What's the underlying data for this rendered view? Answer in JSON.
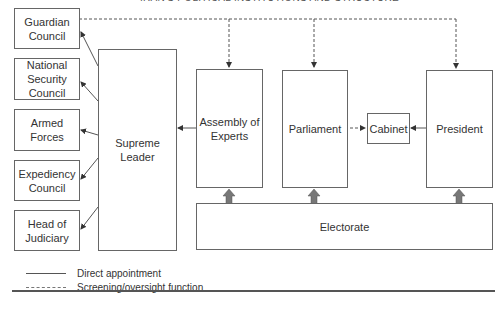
{
  "title": "IRAN'S POLITICAL INSTITUTIONS AND STRUCTURE",
  "appointees": [
    {
      "label": "Guardian Council"
    },
    {
      "label": "National Security Council"
    },
    {
      "label": "Armed Forces"
    },
    {
      "label": "Expediency Council"
    },
    {
      "label": "Head of Judiciary"
    }
  ],
  "supreme_leader": {
    "label": "Supreme Leader"
  },
  "assembly": {
    "label": "Assembly of Experts"
  },
  "parliament": {
    "label": "Parliament"
  },
  "cabinet": {
    "label": "Cabinet"
  },
  "president": {
    "label": "President"
  },
  "electorate": {
    "label": "Electorate"
  },
  "legend": [
    {
      "style": "solid",
      "label": "Direct appointment"
    },
    {
      "style": "dashed",
      "label": "Screening/oversight function"
    }
  ],
  "colors": {
    "line": "#555555",
    "box_border": "#666666",
    "elect_arrow": "#777777"
  }
}
